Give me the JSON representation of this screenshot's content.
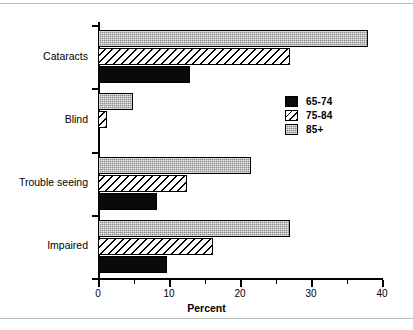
{
  "chart_data": {
    "type": "bar",
    "orientation": "horizontal",
    "title": "",
    "xlabel": "Percent",
    "ylabel": "",
    "xlim": [
      0,
      40
    ],
    "xticks": [
      0,
      10,
      20,
      30,
      40
    ],
    "xtick_labels": [
      "0",
      "10",
      "20",
      "30",
      "40"
    ],
    "xminorticks": [
      5,
      15,
      25,
      35
    ],
    "grid": false,
    "legend_position": "center-right",
    "categories": [
      "Cataracts",
      "Blind",
      "Trouble seeing",
      "Impaired"
    ],
    "series": [
      {
        "name": "65-74",
        "fill": "solid-black",
        "color": "#0a0a0a",
        "values": [
          13.0,
          0.3,
          8.3,
          9.7
        ]
      },
      {
        "name": "75-84",
        "fill": "diagonal-hatch",
        "color": "#ffffff",
        "values": [
          27.0,
          1.2,
          12.6,
          16.2
        ]
      },
      {
        "name": "85+",
        "fill": "gray-stipple",
        "color": "#8a8a8a",
        "values": [
          38.0,
          4.9,
          21.5,
          27.0
        ]
      }
    ]
  },
  "legend": {
    "items": [
      {
        "label": "65-74"
      },
      {
        "label": "75-84"
      },
      {
        "label": "85+"
      }
    ]
  }
}
